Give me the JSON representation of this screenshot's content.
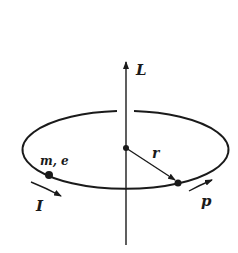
{
  "diagram": {
    "labels": {
      "angular_momentum": "L",
      "radius": "r",
      "mass_charge": "m, e",
      "current": "I",
      "momentum": "p"
    },
    "colors": {
      "ink": "#1a1a1a",
      "background": "#ffffff"
    }
  }
}
